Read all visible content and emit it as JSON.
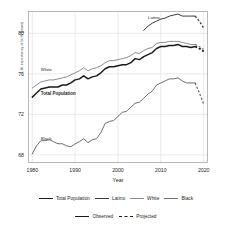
{
  "chart_data": {
    "type": "line",
    "title": "",
    "xlabel": "Year",
    "ylabel": "Life expectancy at birth (years)",
    "xlim": [
      1979,
      2021
    ],
    "ylim": [
      67.2,
      82.2
    ],
    "xticks": [
      1980,
      1990,
      2000,
      2010,
      2020
    ],
    "yticks": [
      68,
      72,
      76,
      80
    ],
    "grid": true,
    "legend_position": "below",
    "annotations": [
      {
        "text": "Latino",
        "x": 2007,
        "y": 81.5
      },
      {
        "text": "White",
        "x": 1982,
        "y": 76.4
      },
      {
        "text": "Total Population",
        "x": 1982,
        "y": 74.0
      },
      {
        "text": "Black",
        "x": 1982,
        "y": 69.6
      }
    ],
    "series": [
      {
        "name": "Total Population",
        "color": "#1a1a1a",
        "observed_x": [
          1980,
          1981,
          1982,
          1983,
          1984,
          1985,
          1986,
          1987,
          1988,
          1989,
          1990,
          1991,
          1992,
          1993,
          1994,
          1995,
          1996,
          1997,
          1998,
          1999,
          2000,
          2001,
          2002,
          2003,
          2004,
          2005,
          2006,
          2007,
          2008,
          2009,
          2010,
          2011,
          2012,
          2013,
          2014,
          2015,
          2016,
          2017,
          2018
        ],
        "observed_y": [
          73.7,
          74.1,
          74.5,
          74.6,
          74.7,
          74.7,
          74.7,
          74.9,
          74.9,
          75.1,
          75.4,
          75.5,
          75.8,
          75.5,
          75.7,
          75.8,
          76.1,
          76.5,
          76.7,
          76.7,
          76.8,
          76.9,
          76.9,
          77.1,
          77.5,
          77.4,
          77.7,
          77.9,
          78.1,
          78.5,
          78.7,
          78.7,
          78.8,
          78.8,
          78.9,
          78.7,
          78.7,
          78.6,
          78.7
        ],
        "projected_x": [
          2018,
          2019,
          2020
        ],
        "projected_y": [
          78.7,
          78.5,
          78.2
        ]
      },
      {
        "name": "Latino",
        "color": "#3a3a3a",
        "observed_x": [
          2006,
          2007,
          2008,
          2009,
          2010,
          2011,
          2012,
          2013,
          2014,
          2015,
          2016,
          2017,
          2018
        ],
        "observed_y": [
          80.3,
          80.7,
          81.0,
          81.2,
          81.4,
          81.5,
          81.7,
          81.8,
          81.9,
          81.7,
          81.7,
          81.7,
          81.7
        ],
        "projected_x": [
          2018,
          2019,
          2020
        ],
        "projected_y": [
          81.7,
          81.2,
          80.5
        ]
      },
      {
        "name": "White",
        "color": "#8c8c8c",
        "observed_x": [
          1980,
          1981,
          1982,
          1983,
          1984,
          1985,
          1986,
          1987,
          1988,
          1989,
          1990,
          1991,
          1992,
          1993,
          1994,
          1995,
          1996,
          1997,
          1998,
          1999,
          2000,
          2001,
          2002,
          2003,
          2004,
          2005,
          2006,
          2007,
          2008,
          2009,
          2010,
          2011,
          2012,
          2013,
          2014,
          2015,
          2016,
          2017,
          2018
        ],
        "observed_y": [
          74.6,
          74.9,
          75.2,
          75.3,
          75.4,
          75.4,
          75.5,
          75.6,
          75.7,
          75.9,
          76.1,
          76.3,
          76.6,
          76.3,
          76.5,
          76.6,
          76.8,
          77.1,
          77.3,
          77.3,
          77.4,
          77.5,
          77.6,
          77.8,
          78.1,
          78.0,
          78.3,
          78.5,
          78.6,
          79.0,
          79.1,
          79.1,
          79.2,
          79.2,
          79.2,
          79.1,
          79.0,
          78.9,
          78.9
        ],
        "projected_x": [
          2018,
          2019,
          2020
        ],
        "projected_y": [
          78.9,
          78.7,
          78.4
        ]
      },
      {
        "name": "Black",
        "color": "#6e6e6e",
        "observed_x": [
          1980,
          1981,
          1982,
          1983,
          1984,
          1985,
          1986,
          1987,
          1988,
          1989,
          1990,
          1991,
          1992,
          1993,
          1994,
          1995,
          1996,
          1997,
          1998,
          1999,
          2000,
          2001,
          2002,
          2003,
          2004,
          2005,
          2006,
          2007,
          2008,
          2009,
          2010,
          2011,
          2012,
          2013,
          2014,
          2015,
          2016,
          2017,
          2018
        ],
        "observed_y": [
          68.1,
          68.9,
          69.4,
          69.4,
          69.5,
          69.3,
          69.1,
          69.1,
          68.9,
          68.8,
          69.1,
          69.3,
          69.6,
          69.2,
          69.5,
          69.6,
          70.2,
          71.1,
          71.3,
          71.4,
          71.8,
          72.2,
          72.3,
          72.7,
          73.1,
          73.2,
          73.6,
          74.0,
          74.3,
          74.9,
          75.1,
          75.3,
          75.5,
          75.5,
          75.6,
          75.3,
          75.1,
          75.1,
          75.1
        ],
        "projected_x": [
          2018,
          2019,
          2020
        ],
        "projected_y": [
          75.1,
          74.1,
          73.0
        ]
      }
    ]
  },
  "legend_series": [
    {
      "label": "Total Population",
      "color": "#1a1a1a",
      "weight": "solid-thick"
    },
    {
      "label": "Latino",
      "color": "#3a3a3a",
      "weight": "solid-med"
    },
    {
      "label": "White",
      "color": "#8c8c8c",
      "weight": "solid-med"
    },
    {
      "label": "Black",
      "color": "#6e6e6e",
      "weight": "solid-med"
    }
  ],
  "legend_style": [
    {
      "label": "Observed",
      "style": "solid-thick",
      "color": "#1a1a1a"
    },
    {
      "label": "Projected",
      "style": "dashed",
      "color": "#1a1a1a"
    }
  ]
}
